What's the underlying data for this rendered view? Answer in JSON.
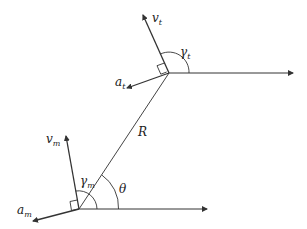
{
  "diagram": {
    "type": "geometry-guidance",
    "colors": {
      "line": "#333333",
      "text": "#222222",
      "background": "#ffffff"
    },
    "labels": {
      "v_t": {
        "base": "v",
        "sub": "t"
      },
      "gamma_t": {
        "base": "γ",
        "sub": "t"
      },
      "a_t": {
        "base": "a",
        "sub": "t"
      },
      "R": {
        "base": "R",
        "sub": ""
      },
      "v_m": {
        "base": "v",
        "sub": "m"
      },
      "gamma_m": {
        "base": "γ",
        "sub": "m"
      },
      "theta": {
        "base": "θ",
        "sub": ""
      },
      "a_m": {
        "base": "a",
        "sub": "m"
      }
    },
    "points": {
      "target": [
        169,
        73
      ],
      "missile": [
        79,
        209
      ]
    }
  }
}
